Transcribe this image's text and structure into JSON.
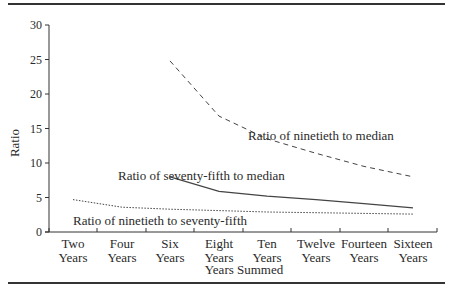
{
  "chart_data": {
    "type": "line",
    "title": "",
    "xlabel": "Years Summed",
    "ylabel": "Ratio",
    "ylim": [
      0,
      30
    ],
    "yticks": [
      0,
      5,
      10,
      15,
      20,
      25,
      30
    ],
    "grid": false,
    "legend": "inline labels",
    "categories": [
      "Two Years",
      "Four Years",
      "Six Years",
      "Eight Years",
      "Ten Years",
      "Twelve Years",
      "Fourteen Years",
      "Sixteen Years"
    ],
    "series": [
      {
        "name": "Ratio of ninetieth to median",
        "style": "dashed",
        "values": [
          null,
          null,
          24.8,
          16.8,
          13.5,
          11.4,
          9.5,
          8.0
        ]
      },
      {
        "name": "Ratio of seventy-fifth to median",
        "style": "solid",
        "values": [
          null,
          null,
          8.0,
          5.9,
          5.2,
          4.7,
          4.1,
          3.5
        ]
      },
      {
        "name": "Ratio of ninetieth to seventy-fifth",
        "style": "dotted",
        "values": [
          4.7,
          3.6,
          3.3,
          3.1,
          2.9,
          2.8,
          2.7,
          2.6
        ]
      }
    ],
    "annotations": [
      {
        "text": "Ratio of ninetieth to median",
        "series": 0
      },
      {
        "text": "Ratio of seventy-fifth to median",
        "series": 1
      },
      {
        "text": "Ratio of ninetieth to seventy-fifth",
        "series": 2
      }
    ]
  },
  "labels": {
    "ylabel": "Ratio",
    "xlabel": "Years Summed",
    "x_line1": [
      "Two",
      "Four",
      "Six",
      "Eight",
      "Ten",
      "Twelve",
      "Fourteen",
      "Sixteen"
    ],
    "x_line2": [
      "Years",
      "Years",
      "Years",
      "Years",
      "Years",
      "Years",
      "Years",
      "Years"
    ],
    "ann_90_50": "Ratio of ninetieth to median",
    "ann_75_50": "Ratio of seventy-fifth to median",
    "ann_90_75": "Ratio of ninetieth to seventy-fifth"
  }
}
